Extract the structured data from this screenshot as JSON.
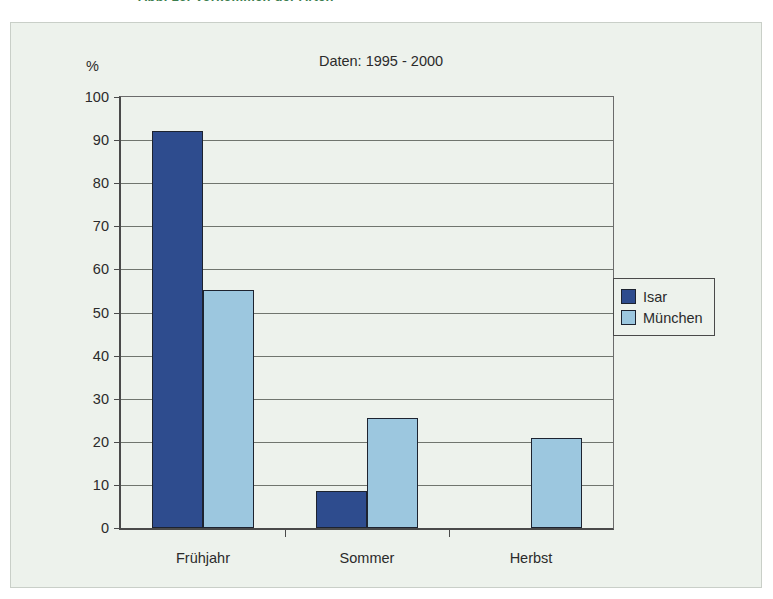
{
  "top_caption": "Abb. 16: Vorkommen der Arten",
  "chart_data": {
    "type": "bar",
    "title": "Daten: 1995 - 2000",
    "xlabel": "",
    "ylabel": "%",
    "categories": [
      "Frühjahr",
      "Sommer",
      "Herbst"
    ],
    "series": [
      {
        "name": "Isar",
        "color": "#2E4C8E",
        "values": [
          92,
          8.5,
          0
        ]
      },
      {
        "name": "München",
        "color": "#9CC7DF",
        "values": [
          55.3,
          25.5,
          21
        ]
      }
    ],
    "ylim": [
      0,
      100
    ],
    "y_ticks": [
      "0",
      "10",
      "20",
      "30",
      "40",
      "50",
      "60",
      "70",
      "80",
      "90",
      "100"
    ],
    "grid": true,
    "legend_position": "right"
  },
  "colors": {
    "isar": "#2E4C8E",
    "muenchen": "#9CC7DF",
    "panel_background": "#edf2ec",
    "axis": "#4a4a4a"
  }
}
